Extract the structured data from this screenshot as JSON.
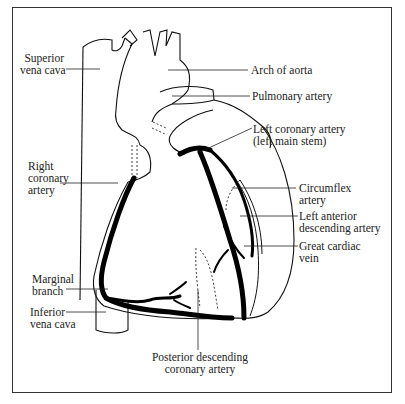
{
  "figure": {
    "labels": {
      "superior_vena_cava": [
        "Superior",
        "vena cava"
      ],
      "arch_of_aorta": "Arch of aorta",
      "pulmonary_artery": "Pulmonary artery",
      "left_coronary_artery": [
        "Left coronary artery",
        "(left main stem)"
      ],
      "right_coronary_artery": [
        "Right",
        "coronary",
        "artery"
      ],
      "circumflex_artery": [
        "Circumflex",
        "artery"
      ],
      "left_anterior_descending": [
        "Left anterior",
        "descending artery"
      ],
      "great_cardiac_vein": [
        "Great cardiac",
        "vein"
      ],
      "marginal_branch": [
        "Marginal",
        "branch"
      ],
      "inferior_vena_cava": [
        "Inferior",
        "vena cava"
      ],
      "posterior_descending": [
        "Posterior descending",
        "coronary artery"
      ]
    }
  }
}
